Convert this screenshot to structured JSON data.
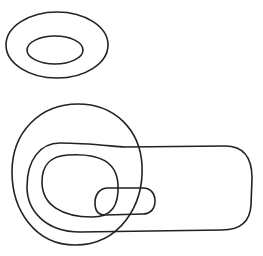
{
  "diagram": {
    "background": "#ffffff",
    "stroke_color": "#222222",
    "stroke_width": 1.6,
    "shapes": [
      {
        "id": "top-outer-ellipse",
        "type": "ellipse",
        "cx": 57,
        "cy": 45,
        "rx": 51,
        "ry": 33
      },
      {
        "id": "top-inner-ellipse",
        "type": "ellipse",
        "cx": 55,
        "cy": 50,
        "rx": 28,
        "ry": 14
      },
      {
        "id": "big-circle",
        "type": "path",
        "d": "M 78 104 C 115 104, 140 130, 142 165 C 144 205, 120 245, 75 245 C 35 245, 12 210, 12 172 C 12 132, 40 104, 78 104 Z"
      },
      {
        "id": "large-stadium",
        "type": "path",
        "d": "M 60 143 C 85 143, 110 146, 125 147 L 225 146 C 245 146, 252 160, 252 178 L 251 205 C 250 222, 240 230, 222 230 L 80 232 C 45 232, 27 210, 27 187 C 27 160, 40 143, 60 143 Z"
      },
      {
        "id": "inner-loop",
        "type": "path",
        "d": "M 68 155 C 100 153, 117 162, 118 185 C 119 205, 112 217, 92 217 C 62 217, 42 205, 42 182 C 42 163, 52 156, 68 155 Z"
      },
      {
        "id": "small-stadium",
        "type": "path",
        "d": "M 108 188 L 143 188 C 151 188, 155 194, 155 201 C 155 208, 151 214, 143 214 L 105 215 C 98 215, 95 210, 95 203 C 95 194, 100 188, 108 188 Z"
      }
    ]
  }
}
